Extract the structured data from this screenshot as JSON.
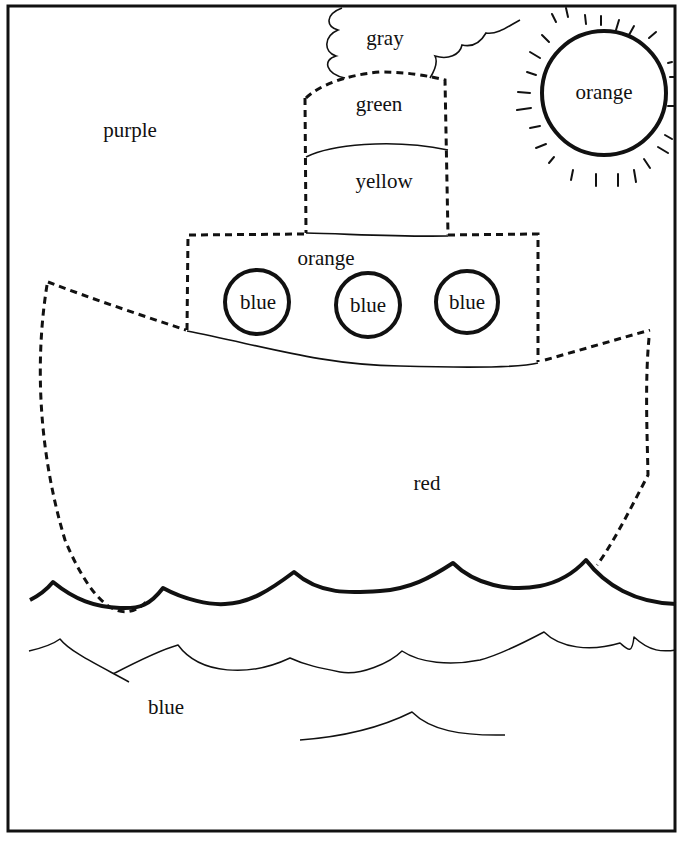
{
  "worksheet": {
    "type": "color-by-word coloring page",
    "subject": "steamboat on the sea"
  },
  "regions": {
    "sky": {
      "label": "purple",
      "x": 130,
      "y": 130
    },
    "smoke_cloud": {
      "label": "gray",
      "x": 385,
      "y": 38
    },
    "smokestack_top": {
      "label": "green",
      "x": 379,
      "y": 104
    },
    "smokestack_bottom": {
      "label": "yellow",
      "x": 384,
      "y": 181
    },
    "sun": {
      "label": "orange",
      "x": 604,
      "y": 92
    },
    "cabin": {
      "label": "orange",
      "x": 326,
      "y": 258
    },
    "porthole_1": {
      "label": "blue",
      "x": 258,
      "y": 302
    },
    "porthole_2": {
      "label": "blue",
      "x": 368,
      "y": 305
    },
    "porthole_3": {
      "label": "blue",
      "x": 467,
      "y": 302
    },
    "hull": {
      "label": "red",
      "x": 427,
      "y": 483
    },
    "sea": {
      "label": "blue",
      "x": 166,
      "y": 707
    }
  },
  "colors": {
    "ink": "#111111",
    "paper": "#ffffff"
  }
}
